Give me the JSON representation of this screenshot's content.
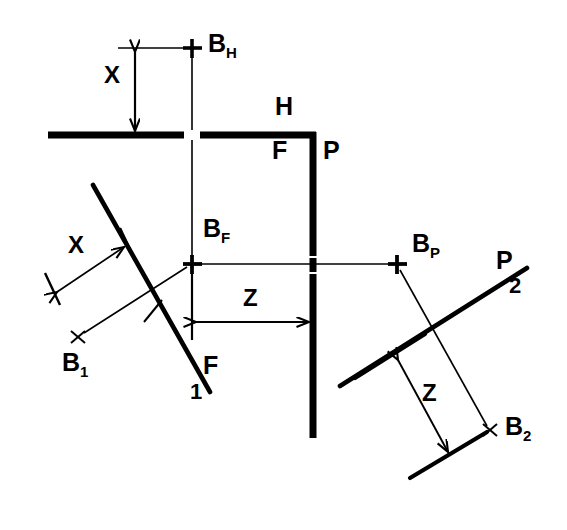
{
  "figure": {
    "type": "engineering-line-diagram",
    "background_color": "#ffffff",
    "ink_color": "#000000"
  },
  "points": [
    {
      "id": "BH",
      "base": "B",
      "sub": "H",
      "label": "B",
      "subscript": "H",
      "marker": "plus",
      "x": 192,
      "y": 48,
      "label_x": 208,
      "label_y": 33
    },
    {
      "id": "BF",
      "base": "B",
      "sub": "F",
      "label": "B",
      "subscript": "F",
      "marker": "plus",
      "x": 192,
      "y": 264,
      "label_x": 202,
      "label_y": 218
    },
    {
      "id": "BP",
      "base": "B",
      "sub": "P",
      "label": "B",
      "subscript": "P",
      "marker": "plus",
      "x": 397,
      "y": 264,
      "label_x": 412,
      "label_y": 233
    },
    {
      "id": "B1",
      "base": "B",
      "sub": "1",
      "label": "B",
      "subscript": "1",
      "marker": "x",
      "x": 78,
      "y": 337,
      "label_x": 62,
      "label_y": 352
    },
    {
      "id": "B2",
      "base": "B",
      "sub": "2",
      "label": "B",
      "subscript": "2",
      "marker": "x",
      "x": 490,
      "y": 430,
      "label_x": 505,
      "label_y": 415
    }
  ],
  "line_labels": [
    {
      "id": "H",
      "text": "H",
      "x": 275,
      "y": 96,
      "note": "thick horizontal datum line label"
    },
    {
      "id": "F",
      "text": "F",
      "x": 272,
      "y": 140,
      "note": "inside corner label for F plane"
    },
    {
      "id": "P",
      "text": "P",
      "x": 323,
      "y": 140,
      "note": "thick vertical line label"
    },
    {
      "id": "F1a",
      "text": "F",
      "x": 203,
      "y": 355,
      "note": "diagonal left line family F"
    },
    {
      "id": "F1b",
      "text": "1",
      "x": 190,
      "y": 383,
      "note": "subscript 1 of F1"
    },
    {
      "id": "P2a",
      "text": "P",
      "x": 496,
      "y": 250,
      "note": "diagonal right line family P"
    },
    {
      "id": "P2b",
      "text": "2",
      "x": 509,
      "y": 277,
      "note": "subscript 2 of P2"
    }
  ],
  "dimensions": [
    {
      "id": "X-top",
      "text": "X",
      "x": 104,
      "y": 65,
      "orientation": "vertical",
      "measures": "B_H to H line"
    },
    {
      "id": "X-left",
      "text": "X",
      "x": 68,
      "y": 235,
      "orientation": "diagonal",
      "measures": "B_1 to F_1 line"
    },
    {
      "id": "Z-center",
      "text": "Z",
      "x": 243,
      "y": 287,
      "orientation": "horizontal",
      "measures": "B_F to P line"
    },
    {
      "id": "Z-right",
      "text": "Z",
      "x": 422,
      "y": 383,
      "orientation": "diagonal",
      "measures": "B_2 to P_2 line"
    }
  ],
  "geometry": {
    "thick_h_line": {
      "x1": 48,
      "y1": 135,
      "x2": 313,
      "y2": 135,
      "width": 7
    },
    "thick_p_line": {
      "x1": 313,
      "y1": 135,
      "x2": 313,
      "y2": 438,
      "width": 7
    },
    "thin_v_line": {
      "x1": 192,
      "y1": 52,
      "x2": 192,
      "y2": 310,
      "width": 1.4
    },
    "thin_h_line": {
      "x1": 192,
      "y1": 264,
      "x2": 397,
      "y2": 264,
      "width": 1.4
    },
    "f1_diagonal": {
      "x1": 93,
      "y1": 185,
      "x2": 210,
      "y2": 392,
      "width": 4.5
    },
    "p2_diagonal": {
      "x1": 340,
      "y1": 385,
      "x2": 527,
      "y2": 268,
      "width": 4.5
    },
    "b1_lead": {
      "x1": 78,
      "y1": 337,
      "x2": 192,
      "y2": 264,
      "width": 1.4
    },
    "b2_lead": {
      "x1": 397,
      "y1": 264,
      "x2": 490,
      "y2": 430,
      "width": 1.4
    }
  }
}
